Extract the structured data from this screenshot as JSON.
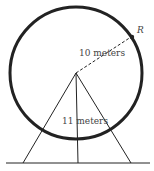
{
  "diagram": {
    "point_label": "R",
    "radius_label": "10 meters",
    "height_label": "11 meters",
    "stroke_color": "#222222"
  }
}
